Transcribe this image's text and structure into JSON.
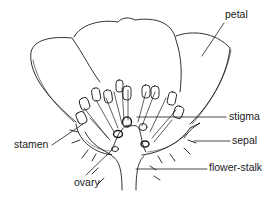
{
  "diagram": {
    "labels": [
      {
        "id": "petal",
        "text": "petal",
        "x": 225,
        "y": 9
      },
      {
        "id": "stigma",
        "text": "stigma",
        "x": 229,
        "y": 111
      },
      {
        "id": "sepal",
        "text": "sepal",
        "x": 232,
        "y": 135
      },
      {
        "id": "flower-stalk",
        "text": "flower-stalk",
        "x": 209,
        "y": 162
      },
      {
        "id": "stamen",
        "text": "stamen",
        "x": 14,
        "y": 139
      },
      {
        "id": "ovary",
        "text": "ovary",
        "x": 74,
        "y": 177
      }
    ],
    "colors": {
      "line": "#1a1a1a",
      "background": "#ffffff"
    }
  }
}
